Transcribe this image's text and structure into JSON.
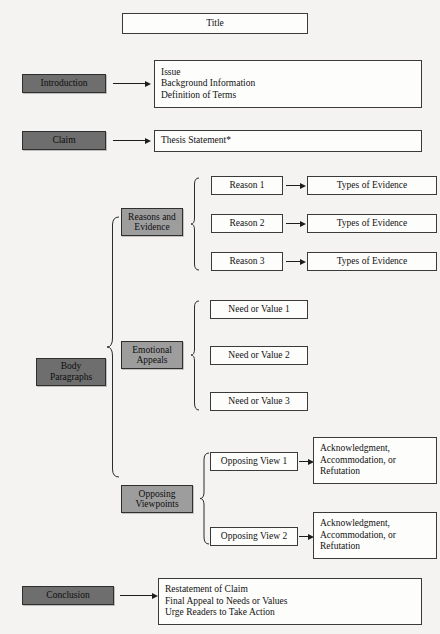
{
  "diagram": {
    "type": "flow-outline",
    "title_box": {
      "label": "Title"
    },
    "colors": {
      "stage_fill": "#6e6e6e",
      "substage_fill": "#9d9d9d",
      "box_fill": "#fdfdfc",
      "border": "#3a3a3a",
      "page_bg": "#f4f3f1"
    },
    "stages": [
      {
        "label": "Introduction"
      },
      {
        "label": "Claim"
      },
      {
        "label_line1": "Body",
        "label_line2": "Paragraphs"
      },
      {
        "label": "Conclusion"
      }
    ],
    "introduction_content": {
      "lines": [
        "Issue",
        "Background Information",
        "Definition of Terms"
      ]
    },
    "claim_content": {
      "lines": [
        "Thesis Statement*"
      ]
    },
    "body": {
      "substages": [
        {
          "label_line1": "Reasons and",
          "label_line2": "Evidence"
        },
        {
          "label_line1": "Emotional",
          "label_line2": "Appeals"
        },
        {
          "label_line1": "Opposing",
          "label_line2": "Viewpoints"
        }
      ],
      "reasons": [
        {
          "label": "Reason 1",
          "evidence": "Types of Evidence"
        },
        {
          "label": "Reason 2",
          "evidence": "Types of Evidence"
        },
        {
          "label": "Reason 3",
          "evidence": "Types of Evidence"
        }
      ],
      "needs_values": [
        {
          "label": "Need or Value 1"
        },
        {
          "label": "Need or Value 2"
        },
        {
          "label": "Need or Value 3"
        }
      ],
      "opposing_views": [
        {
          "label": "Opposing View 1",
          "response_lines": [
            "Acknowledgment,",
            "Accommodation, or",
            "Refutation"
          ]
        },
        {
          "label": "Opposing View 2",
          "response_lines": [
            "Acknowledgment,",
            "Accommodation, or",
            "Refutation"
          ]
        }
      ]
    },
    "conclusion_content": {
      "lines": [
        "Restatement of Claim",
        "Final Appeal to Needs or Values",
        "Urge Readers to Take Action"
      ]
    }
  }
}
